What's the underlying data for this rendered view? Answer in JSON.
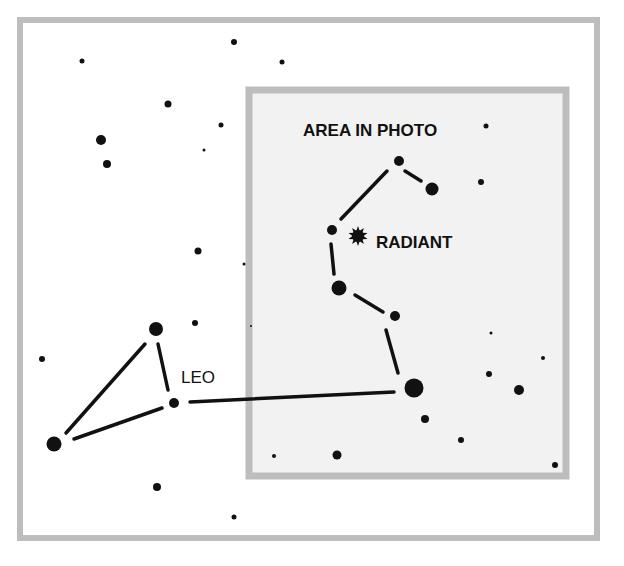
{
  "diagram": {
    "title_label": "AREA IN PHOTO",
    "radiant_label": "RADIANT",
    "constellation_label": "LEO",
    "colors": {
      "background": "#ffffff",
      "frame": "#bdbdbd",
      "photo_area_fill": "#f2f2f2",
      "star": "#111111"
    },
    "outer_frame": {
      "x": 20,
      "y": 20,
      "w": 577,
      "h": 518,
      "stroke": 6
    },
    "photo_area": {
      "x": 249,
      "y": 90,
      "w": 317,
      "h": 386,
      "stroke": 7
    },
    "radiant": {
      "x": 358,
      "y": 236,
      "icon": "starburst-icon"
    },
    "stars": [
      {
        "x": 82,
        "y": 61,
        "r": 2.5
      },
      {
        "x": 234,
        "y": 42,
        "r": 3
      },
      {
        "x": 282,
        "y": 62,
        "r": 2.5
      },
      {
        "x": 168,
        "y": 104,
        "r": 3.5
      },
      {
        "x": 221,
        "y": 125,
        "r": 2.5
      },
      {
        "x": 204,
        "y": 150,
        "r": 1.5
      },
      {
        "x": 101,
        "y": 140,
        "r": 5
      },
      {
        "x": 107,
        "y": 164,
        "r": 4
      },
      {
        "x": 198,
        "y": 251,
        "r": 3.5
      },
      {
        "x": 244,
        "y": 264,
        "r": 1.5
      },
      {
        "x": 156,
        "y": 329,
        "r": 7
      },
      {
        "x": 174,
        "y": 403,
        "r": 5
      },
      {
        "x": 54,
        "y": 444,
        "r": 7.5
      },
      {
        "x": 195,
        "y": 323,
        "r": 3
      },
      {
        "x": 251,
        "y": 326,
        "r": 1
      },
      {
        "x": 42,
        "y": 359,
        "r": 3
      },
      {
        "x": 157,
        "y": 487,
        "r": 4
      },
      {
        "x": 234,
        "y": 517,
        "r": 2.5
      },
      {
        "x": 274,
        "y": 456,
        "r": 2
      },
      {
        "x": 399,
        "y": 161,
        "r": 5
      },
      {
        "x": 432,
        "y": 189,
        "r": 6.5
      },
      {
        "x": 486,
        "y": 126,
        "r": 2.5
      },
      {
        "x": 481,
        "y": 182,
        "r": 3
      },
      {
        "x": 332,
        "y": 230,
        "r": 5
      },
      {
        "x": 339,
        "y": 288,
        "r": 7.5
      },
      {
        "x": 395,
        "y": 316,
        "r": 5
      },
      {
        "x": 414,
        "y": 388,
        "r": 9.5
      },
      {
        "x": 491,
        "y": 333,
        "r": 1.5
      },
      {
        "x": 543,
        "y": 358,
        "r": 2
      },
      {
        "x": 489,
        "y": 374,
        "r": 3
      },
      {
        "x": 519,
        "y": 390,
        "r": 5
      },
      {
        "x": 425,
        "y": 419,
        "r": 4
      },
      {
        "x": 461,
        "y": 440,
        "r": 3
      },
      {
        "x": 337,
        "y": 455,
        "r": 4.5
      },
      {
        "x": 555,
        "y": 465,
        "r": 3
      }
    ],
    "lines": [
      {
        "x1": 145,
        "y1": 344,
        "x2": 66,
        "y2": 433
      },
      {
        "x1": 158,
        "y1": 344,
        "x2": 168,
        "y2": 390
      },
      {
        "x1": 162,
        "y1": 408,
        "x2": 74,
        "y2": 439
      },
      {
        "x1": 190,
        "y1": 402,
        "x2": 394,
        "y2": 392
      },
      {
        "x1": 398,
        "y1": 373,
        "x2": 386,
        "y2": 330
      },
      {
        "x1": 383,
        "y1": 312,
        "x2": 355,
        "y2": 295
      },
      {
        "x1": 334,
        "y1": 274,
        "x2": 331,
        "y2": 244
      },
      {
        "x1": 341,
        "y1": 219,
        "x2": 387,
        "y2": 171
      },
      {
        "x1": 405,
        "y1": 171,
        "x2": 421,
        "y2": 181
      }
    ]
  }
}
